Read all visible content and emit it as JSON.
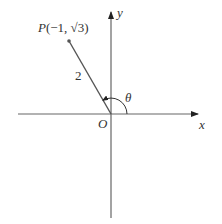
{
  "diagram": {
    "title": "",
    "axes": {
      "x_label": "x",
      "y_label": "y",
      "origin_label": "O"
    },
    "point": {
      "name": "P",
      "coords_label": "(−1, √3)",
      "full_label": "P(−1, √3)"
    },
    "segment": {
      "length_label": "2"
    },
    "angle": {
      "label": "θ"
    },
    "colors": {
      "line": "#555555",
      "text": "#333333"
    }
  }
}
